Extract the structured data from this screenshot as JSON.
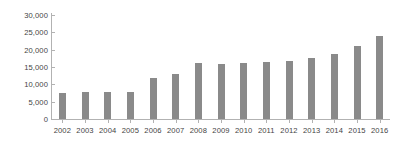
{
  "chart_data": {
    "type": "bar",
    "title": "",
    "subtitle": "",
    "xlabel": "",
    "ylabel": "",
    "categories": [
      "2002",
      "2003",
      "2004",
      "2005",
      "2006",
      "2007",
      "2008",
      "2009",
      "2010",
      "2011",
      "2012",
      "2013",
      "2014",
      "2015",
      "2016"
    ],
    "values": [
      7400,
      7800,
      7700,
      7900,
      11800,
      13100,
      16300,
      15900,
      16300,
      16400,
      16800,
      17600,
      18700,
      21200,
      24000
    ],
    "series": [
      {
        "name": "",
        "values": [
          7400,
          7800,
          7700,
          7900,
          11800,
          13100,
          16300,
          15900,
          16300,
          16400,
          16800,
          17600,
          18700,
          21200,
          24000
        ]
      }
    ],
    "ylim": [
      0,
      30000
    ],
    "ytick_values": [
      0,
      5000,
      10000,
      15000,
      20000,
      25000,
      30000
    ],
    "ytick_labels": [
      "0",
      "5,000",
      "10,000",
      "15,000",
      "20,000",
      "25,000",
      "30,000"
    ],
    "grid": false,
    "legend": false,
    "legend_position": "none",
    "bar_color": "#8a8a8a",
    "axis_color": "#b2b2b2",
    "text_color": "#444444",
    "background_color": "#ffffff"
  }
}
